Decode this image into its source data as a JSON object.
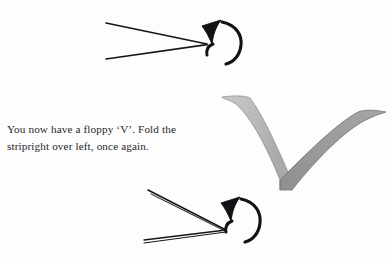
{
  "page": {
    "background_color": "#fdfdfd",
    "width": 391,
    "height": 258
  },
  "caption": {
    "line1": "You now have a floppy ‘V’. Fold the",
    "line2": "striphght over left, once again.",
    "line2_actual": "stripright over left, once again.",
    "text_color": "#26262a"
  },
  "figures": {
    "top": {
      "name": "open-v-with-rotation-arrow",
      "description": "Wide open V of two black lines, apex at right, with circular rotation arrow at the apex",
      "stroke_color": "#15151a",
      "arrow_color": "#111116"
    },
    "ribbon": {
      "name": "floppy-v-ribbon",
      "description": "Gray folded paper strip forming a floppy V / checkmark",
      "left_arm_color": "#b4b4b4",
      "left_arm_color_light": "#cfcfcf",
      "left_arm_edge_color": "#8d8d8d",
      "right_arm_color": "#9a9a9a",
      "right_arm_edge_color": "#6f6f6f"
    },
    "bottom": {
      "name": "narrow-v-with-rotation-arrow",
      "description": "Narrow double-line V wedge, apex at right, with circular rotation arrow at the apex",
      "stroke_color": "#15151a",
      "arrow_color": "#111116"
    }
  }
}
